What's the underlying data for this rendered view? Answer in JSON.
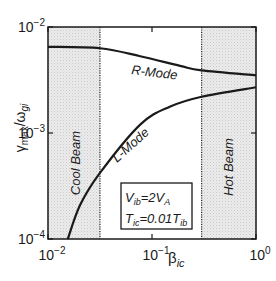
{
  "chart_data": {
    "type": "line",
    "title": "",
    "xlabel": "β_ic",
    "ylabel": "γ_max/ω_gi",
    "xscale": "log",
    "yscale": "log",
    "xlim": [
      0.01,
      1
    ],
    "ylim": [
      0.0001,
      0.01
    ],
    "grid": false,
    "x_ticks": [
      {
        "value": 0.01,
        "base": "10",
        "exp": "−2"
      },
      {
        "value": 0.1,
        "base": "10",
        "exp": "−1"
      },
      {
        "value": 1,
        "base": "10",
        "exp": "0"
      }
    ],
    "y_ticks": [
      {
        "value": 0.0001,
        "base": "10",
        "exp": "−4"
      },
      {
        "value": 0.001,
        "base": "10",
        "exp": "−3"
      },
      {
        "value": 0.01,
        "base": "10",
        "exp": "−2"
      }
    ],
    "series": [
      {
        "name": "R-Mode",
        "x": [
          0.01,
          0.0316,
          0.077,
          0.186,
          0.3,
          1.0
        ],
        "y": [
          0.0065,
          0.0063,
          0.0053,
          0.0043,
          0.0039,
          0.0035
        ]
      },
      {
        "name": "L-Mode",
        "x": [
          0.0155,
          0.0204,
          0.0316,
          0.077,
          0.148,
          0.3,
          1.0
        ],
        "y": [
          0.0001,
          0.00021,
          0.00042,
          0.0012,
          0.00177,
          0.0022,
          0.0027
        ]
      }
    ],
    "regions": [
      {
        "label": "Cool Beam",
        "x_range": [
          0.01,
          0.0316
        ],
        "shaded": true
      },
      {
        "label": "Hot Beam",
        "x_range": [
          0.3,
          1.0
        ],
        "shaded": true
      }
    ],
    "boundaries": [
      0.0316,
      0.3
    ],
    "annotations": [
      {
        "text": "R-Mode"
      },
      {
        "text": "L-Mode"
      },
      {
        "text": "Cool Beam"
      },
      {
        "text": "Hot Beam"
      }
    ],
    "parameter_box": {
      "line1": {
        "v": "V",
        "v_sub": "ib",
        "eq": "=2",
        "va": "V",
        "va_sub": "A"
      },
      "line2": {
        "t": "T",
        "t_sub": "ic",
        "eq": "=0.01",
        "tb": "T",
        "tb_sub": "ib"
      }
    },
    "axis_labels": {
      "x": {
        "main": "β",
        "sub": "ic"
      },
      "y": {
        "gamma": "γ",
        "gamma_sub": "max",
        "slash": "/",
        "omega": "ω",
        "omega_sub": "gi"
      }
    },
    "colors": {
      "curve": "#1a1a1a",
      "shade": "#e6e6e6",
      "axes": "#1a1a1a"
    }
  }
}
